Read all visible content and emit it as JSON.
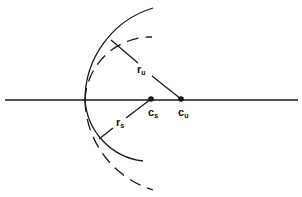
{
  "diagram": {
    "type": "geometric construction",
    "colors": {
      "background": "#ffffff",
      "stroke": "#1a1a1a"
    },
    "axis": {
      "y": 100,
      "x1": 5,
      "x2": 298
    },
    "points": [
      {
        "id": "c_s",
        "label": "c",
        "subscript": "s",
        "x": 151,
        "y": 99
      },
      {
        "id": "c_u",
        "label": "c",
        "subscript": "u",
        "x": 181,
        "y": 99
      }
    ],
    "circles": [
      {
        "id": "unstable",
        "center": "c_u",
        "radius_label": "r",
        "radius_subscript": "u",
        "solid_part": "upper",
        "dashed_part": "lower"
      },
      {
        "id": "stable",
        "center": "c_s",
        "radius_label": "r",
        "radius_subscript": "s",
        "solid_part": "lower",
        "dashed_part": "upper"
      }
    ],
    "labels": {
      "r_u": {
        "main": "r",
        "sub": "u"
      },
      "r_s": {
        "main": "r",
        "sub": "s"
      },
      "c_s": {
        "main": "c",
        "sub": "s"
      },
      "c_u": {
        "main": "c",
        "sub": "u"
      }
    }
  }
}
